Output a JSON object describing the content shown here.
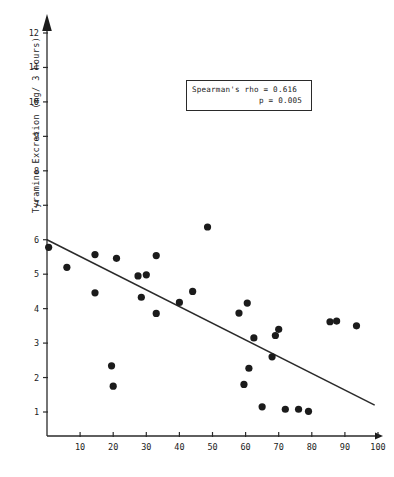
{
  "chart_data": {
    "type": "scatter",
    "title": "",
    "xlabel": "",
    "ylabel": "Tyramine Excretion  (mg/ 3 hours)",
    "xlim": [
      0,
      100
    ],
    "ylim": [
      0,
      12.6
    ],
    "xticks": [
      10,
      20,
      30,
      40,
      50,
      60,
      70,
      80,
      90,
      100
    ],
    "yticks": [
      1,
      2,
      3,
      4,
      5,
      6,
      7,
      8,
      9,
      10,
      11,
      12
    ],
    "grid": false,
    "legend": null,
    "marker_color": "#1b1b1b",
    "line_color": "#2a2a2a",
    "annotations": [
      {
        "name": "spearman-rho",
        "text": "Spearman's rho = 0.616"
      },
      {
        "name": "p-value",
        "text": "p = 0.005"
      }
    ],
    "trendline": {
      "x": [
        0,
        99
      ],
      "y": [
        6.0,
        1.2
      ]
    },
    "points": [
      {
        "x": 0.5,
        "y": 5.78
      },
      {
        "x": 6.0,
        "y": 5.2
      },
      {
        "x": 14.5,
        "y": 5.57
      },
      {
        "x": 14.5,
        "y": 4.46
      },
      {
        "x": 19.5,
        "y": 2.34
      },
      {
        "x": 20.0,
        "y": 1.75
      },
      {
        "x": 21.0,
        "y": 5.46
      },
      {
        "x": 27.5,
        "y": 4.95
      },
      {
        "x": 28.5,
        "y": 4.33
      },
      {
        "x": 30.0,
        "y": 4.98
      },
      {
        "x": 33.0,
        "y": 5.54
      },
      {
        "x": 33.0,
        "y": 3.86
      },
      {
        "x": 40.0,
        "y": 4.18
      },
      {
        "x": 44.0,
        "y": 4.5
      },
      {
        "x": 48.5,
        "y": 6.37
      },
      {
        "x": 58.0,
        "y": 3.87
      },
      {
        "x": 60.5,
        "y": 4.16
      },
      {
        "x": 59.5,
        "y": 1.8
      },
      {
        "x": 61.0,
        "y": 2.27
      },
      {
        "x": 62.5,
        "y": 3.15
      },
      {
        "x": 65.0,
        "y": 1.15
      },
      {
        "x": 68.0,
        "y": 2.6
      },
      {
        "x": 69.0,
        "y": 3.22
      },
      {
        "x": 70.0,
        "y": 3.4
      },
      {
        "x": 72.0,
        "y": 1.08
      },
      {
        "x": 76.0,
        "y": 1.08
      },
      {
        "x": 79.0,
        "y": 1.02
      },
      {
        "x": 85.5,
        "y": 3.62
      },
      {
        "x": 87.5,
        "y": 3.64
      },
      {
        "x": 93.5,
        "y": 3.5
      }
    ]
  }
}
